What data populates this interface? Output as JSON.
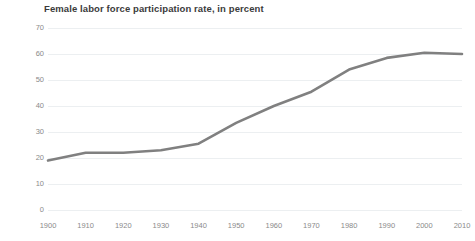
{
  "chart_data": {
    "type": "line",
    "title": "Female labor force participation rate, in percent",
    "subtitle": "",
    "xlabel": "",
    "ylabel": "",
    "xlim": [
      1900,
      2010
    ],
    "ylim": [
      0,
      70
    ],
    "y_ticks": [
      70,
      60,
      50,
      40,
      30,
      20,
      10,
      0
    ],
    "x_ticks": [
      1900,
      1910,
      1920,
      1930,
      1940,
      1950,
      1960,
      1970,
      1980,
      1990,
      2000,
      2010
    ],
    "x_tick_labels": [
      "1900",
      "1910",
      "1920",
      "1930",
      "1940",
      "1950",
      "1960",
      "1970",
      "1980",
      "1990",
      "2000",
      "2010"
    ],
    "y_tick_labels": [
      "70",
      "60",
      "50",
      "40",
      "30",
      "20",
      "10",
      "0"
    ],
    "grid": true,
    "grid_axis": "y",
    "legend": false,
    "legend_position": "none",
    "markers": false,
    "x": [
      1900,
      1910,
      1920,
      1930,
      1940,
      1950,
      1960,
      1970,
      1980,
      1990,
      2000,
      2010
    ],
    "values": [
      19,
      22,
      22,
      23,
      25.5,
      33.5,
      40,
      45.5,
      54,
      58.5,
      60.5,
      60
    ],
    "series": [
      {
        "name": "Female labor force participation rate",
        "color": "#808080",
        "line_width": 2.6,
        "values": [
          19,
          22,
          22,
          23,
          25.5,
          33.5,
          40,
          45.5,
          54,
          58.5,
          60.5,
          60
        ]
      }
    ],
    "annotations": []
  },
  "colors": {
    "line": "#808080",
    "gridline": "#eceff1",
    "tick_label": "#8a8a8a",
    "title": "#3b3b3b",
    "background": "#ffffff"
  }
}
